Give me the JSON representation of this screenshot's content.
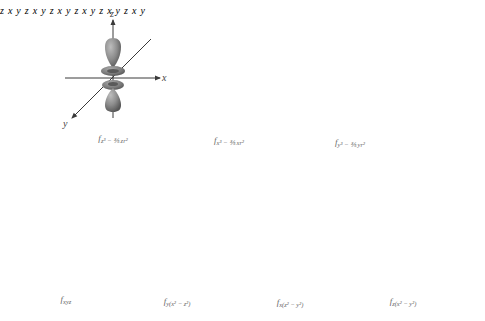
{
  "figure": {
    "panels": [
      {
        "id": "fz3",
        "caption_main": "f",
        "caption_sub": "z³ − ⅗ zr²",
        "axes": {
          "x": "x",
          "y": "y",
          "z": "z"
        }
      },
      {
        "id": "fx3",
        "caption_main": "f",
        "caption_sub": "x³ − ⅗ xr²",
        "axes": {
          "x": "x",
          "y": "y",
          "z": "z"
        }
      },
      {
        "id": "fy3",
        "caption_main": "f",
        "caption_sub": "y³ − ⅗ yr²",
        "axes": {
          "x": "x",
          "y": "y",
          "z": "z"
        }
      },
      {
        "id": "fxyz",
        "caption_main": "f",
        "caption_sub": "xyz",
        "axes": {
          "x": "x",
          "y": "y",
          "z": "z"
        }
      },
      {
        "id": "fyx2z2",
        "caption_main": "f",
        "caption_sub": "y(x² − z²)",
        "axes": {
          "x": "x",
          "y": "y",
          "z": "z"
        }
      },
      {
        "id": "fxz2y2",
        "caption_main": "f",
        "caption_sub": "x(z² − y²)",
        "axes": {
          "x": "x",
          "y": "y",
          "z": "z"
        }
      },
      {
        "id": "fzx2y2",
        "caption_main": "f",
        "caption_sub": "z(x² − y²)",
        "axes": {
          "x": "x",
          "y": "y",
          "z": "z"
        }
      }
    ],
    "colors": {
      "lobe": "#8c8c8c",
      "lobe_highlight": "#b4b4b4",
      "lobe_shadow": "#5a5a5a",
      "axis": "#3a3a3a",
      "background": "#ffffff"
    }
  }
}
